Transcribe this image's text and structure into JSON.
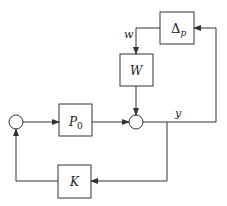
{
  "diagram": {
    "type": "block-diagram",
    "blocks": {
      "delta": {
        "label": "Δ",
        "subscript": "p"
      },
      "w": {
        "label": "W"
      },
      "p0": {
        "label": "P",
        "subscript": "0"
      },
      "k": {
        "label": "K"
      }
    },
    "signals": {
      "w": "w",
      "y": "y"
    },
    "colors": {
      "stroke": "#333333",
      "background": "#ffffff"
    }
  }
}
